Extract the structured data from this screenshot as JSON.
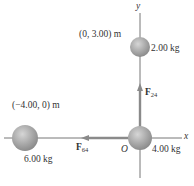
{
  "axes": {
    "x_label": "x",
    "y_label": "y",
    "origin_label": "O"
  },
  "masses": [
    {
      "id": "m2",
      "mass_label": "2.00 kg",
      "position_label": "(0, 3.00) m"
    },
    {
      "id": "m4",
      "mass_label": "4.00 kg"
    },
    {
      "id": "m6",
      "mass_label": "6.00 kg",
      "position_label": "(−4.00, 0) m"
    }
  ],
  "forces": [
    {
      "id": "F24",
      "symbol": "F",
      "subscript": "24",
      "direction": "up"
    },
    {
      "id": "F64",
      "symbol": "F",
      "subscript": "64",
      "direction": "left"
    }
  ],
  "colors": {
    "axis": "#555555",
    "sphere": "#a8a8a8",
    "arrow": "#8a8a8a",
    "text": "#333333"
  }
}
